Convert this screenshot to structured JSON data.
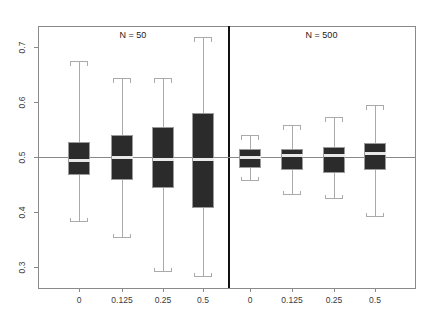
{
  "figure": {
    "background": "#ffffff",
    "box_fill": "#2b2b2b",
    "box_stroke": "#9a9a9a",
    "whisker_color": "#aaaaaa",
    "median_color": "#e8e8e8",
    "axis_color": "#8a8a8a",
    "divider_color": "#111111",
    "reference_line_color": "#888888",
    "plot_left": 38,
    "plot_right": 415,
    "plot_top": 26,
    "plot_bottom": 288,
    "divider_x": 228
  },
  "axes": {
    "y": {
      "ticks": [
        0.3,
        0.4,
        0.5,
        0.6,
        0.7
      ],
      "tick_labels": [
        "0.3",
        "0.4",
        "0.5",
        "0.6",
        "0.7"
      ],
      "min": 0.262,
      "max": 0.738
    },
    "x": {
      "tick_labels": [
        "0",
        "0.125",
        "0.25",
        "0.5",
        "0",
        "0.125",
        "0.25",
        "0.5"
      ]
    }
  },
  "reference_line": {
    "value": 0.5
  },
  "panels": [
    {
      "title": "N = 50",
      "label": "N = 50"
    },
    {
      "title": "N = 500",
      "label": "N = 500"
    }
  ],
  "chart_data": {
    "type": "box",
    "title": "",
    "xlabel": "",
    "ylabel": "",
    "ylim": [
      0.262,
      0.738
    ],
    "grid": false,
    "legend": "none",
    "reference_line": 0.5,
    "groups": [
      "N = 50",
      "N = 500"
    ],
    "categories": [
      "0",
      "0.125",
      "0.25",
      "0.5"
    ],
    "boxes": [
      {
        "panel": "N = 50",
        "category": "0",
        "cx": 79,
        "half_width": 11,
        "whisker_high": 0.675,
        "q3": 0.527,
        "median": 0.494,
        "q1": 0.47,
        "whisker_low": 0.383
      },
      {
        "panel": "N = 50",
        "category": "0.125",
        "cx": 122,
        "half_width": 11,
        "whisker_high": 0.643,
        "q3": 0.54,
        "median": 0.5,
        "q1": 0.46,
        "whisker_low": 0.355
      },
      {
        "panel": "N = 50",
        "category": "0.25",
        "cx": 163,
        "half_width": 11,
        "whisker_high": 0.643,
        "q3": 0.555,
        "median": 0.496,
        "q1": 0.446,
        "whisker_low": 0.292
      },
      {
        "panel": "N = 50",
        "category": "0.5",
        "cx": 203,
        "half_width": 11,
        "whisker_high": 0.718,
        "q3": 0.58,
        "median": 0.496,
        "q1": 0.41,
        "whisker_low": 0.283
      },
      {
        "panel": "N = 500",
        "category": "0",
        "cx": 250,
        "half_width": 11,
        "whisker_high": 0.54,
        "q3": 0.514,
        "median": 0.5,
        "q1": 0.482,
        "whisker_low": 0.458
      },
      {
        "panel": "N = 500",
        "category": "0.125",
        "cx": 292,
        "half_width": 11,
        "whisker_high": 0.558,
        "q3": 0.514,
        "median": 0.503,
        "q1": 0.478,
        "whisker_low": 0.432
      },
      {
        "panel": "N = 500",
        "category": "0.25",
        "cx": 334,
        "half_width": 11,
        "whisker_high": 0.572,
        "q3": 0.518,
        "median": 0.503,
        "q1": 0.472,
        "whisker_low": 0.425
      },
      {
        "panel": "N = 500",
        "category": "0.5",
        "cx": 375,
        "half_width": 11,
        "whisker_high": 0.594,
        "q3": 0.525,
        "median": 0.507,
        "q1": 0.478,
        "whisker_low": 0.393
      }
    ]
  }
}
